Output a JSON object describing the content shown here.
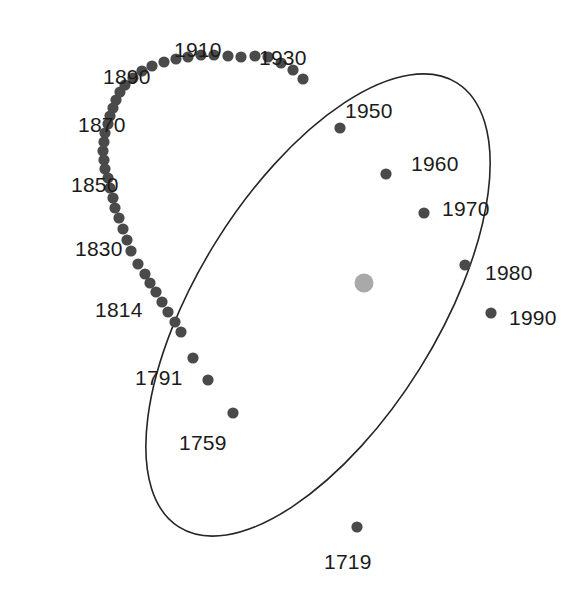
{
  "figure": {
    "kind": "orbital-ellipse-diagram",
    "background_color": "#ffffff",
    "width": 587,
    "height": 597
  },
  "chart_data": {
    "type": "scatter",
    "title": "",
    "subtitle": "",
    "xlabel": "",
    "ylabel": "",
    "grid": false,
    "legend": null,
    "axes_visible": false,
    "xlim": [
      0,
      587
    ],
    "ylim": [
      0,
      597
    ],
    "orbit_path": {
      "name": "orbit-ellipse",
      "stroke_color": "#262626",
      "stroke_width": 1.6,
      "fill": "none",
      "center_x": 318,
      "center_y": 305,
      "radius_x": 120,
      "radius_y": 262,
      "rotation_deg": 32
    },
    "central_body": {
      "name": "sun",
      "x": 364,
      "y": 283,
      "radius": 9.5,
      "color": "#a9a9a9"
    },
    "marker_style": {
      "color": "#4a4a4a",
      "radius": 5.6
    },
    "labels": [
      {
        "text": "1910",
        "x": 174,
        "y": 39
      },
      {
        "text": "1930",
        "x": 259,
        "y": 47
      },
      {
        "text": "1890",
        "x": 103,
        "y": 66
      },
      {
        "text": "1950",
        "x": 345,
        "y": 100
      },
      {
        "text": "1870",
        "x": 78,
        "y": 114
      },
      {
        "text": "1960",
        "x": 411,
        "y": 153
      },
      {
        "text": "1850",
        "x": 71,
        "y": 174
      },
      {
        "text": "1970",
        "x": 442,
        "y": 198
      },
      {
        "text": "1830",
        "x": 75,
        "y": 238
      },
      {
        "text": "1980",
        "x": 485,
        "y": 262
      },
      {
        "text": "1814",
        "x": 95,
        "y": 299
      },
      {
        "text": "1990",
        "x": 509,
        "y": 307
      },
      {
        "text": "1791",
        "x": 135,
        "y": 367
      },
      {
        "text": "1759",
        "x": 179,
        "y": 432
      },
      {
        "text": "1719",
        "x": 324,
        "y": 551
      }
    ],
    "points": [
      {
        "x": 268,
        "y": 57,
        "year": "1930"
      },
      {
        "x": 255,
        "y": 56,
        "year": ""
      },
      {
        "x": 241,
        "y": 57,
        "year": ""
      },
      {
        "x": 228,
        "y": 56,
        "year": ""
      },
      {
        "x": 214,
        "y": 55,
        "year": ""
      },
      {
        "x": 201,
        "y": 55,
        "year": "1910"
      },
      {
        "x": 188,
        "y": 57,
        "year": ""
      },
      {
        "x": 176,
        "y": 59,
        "year": ""
      },
      {
        "x": 164,
        "y": 62,
        "year": ""
      },
      {
        "x": 152,
        "y": 66,
        "year": ""
      },
      {
        "x": 142,
        "y": 71,
        "year": "1890"
      },
      {
        "x": 133,
        "y": 78,
        "year": ""
      },
      {
        "x": 125,
        "y": 85,
        "year": ""
      },
      {
        "x": 120,
        "y": 92,
        "year": ""
      },
      {
        "x": 116,
        "y": 100,
        "year": ""
      },
      {
        "x": 113,
        "y": 108,
        "year": ""
      },
      {
        "x": 110,
        "y": 116,
        "year": "1870"
      },
      {
        "x": 108,
        "y": 124,
        "year": ""
      },
      {
        "x": 105,
        "y": 133,
        "year": ""
      },
      {
        "x": 104,
        "y": 142,
        "year": ""
      },
      {
        "x": 103,
        "y": 151,
        "year": ""
      },
      {
        "x": 104,
        "y": 160,
        "year": ""
      },
      {
        "x": 105,
        "y": 169,
        "year": ""
      },
      {
        "x": 108,
        "y": 178,
        "year": "1850"
      },
      {
        "x": 110,
        "y": 188,
        "year": ""
      },
      {
        "x": 113,
        "y": 198,
        "year": ""
      },
      {
        "x": 115,
        "y": 208,
        "year": ""
      },
      {
        "x": 119,
        "y": 218,
        "year": ""
      },
      {
        "x": 123,
        "y": 229,
        "year": ""
      },
      {
        "x": 127,
        "y": 240,
        "year": "1830"
      },
      {
        "x": 131,
        "y": 251,
        "year": ""
      },
      {
        "x": 138,
        "y": 264,
        "year": ""
      },
      {
        "x": 145,
        "y": 274,
        "year": ""
      },
      {
        "x": 150,
        "y": 283,
        "year": ""
      },
      {
        "x": 156,
        "y": 292,
        "year": ""
      },
      {
        "x": 162,
        "y": 302,
        "year": "1814"
      },
      {
        "x": 168,
        "y": 312,
        "year": ""
      },
      {
        "x": 175,
        "y": 322,
        "year": ""
      },
      {
        "x": 181,
        "y": 332,
        "year": ""
      },
      {
        "x": 193,
        "y": 358,
        "year": "1791"
      },
      {
        "x": 208,
        "y": 380,
        "year": ""
      },
      {
        "x": 233,
        "y": 413,
        "year": "1759"
      },
      {
        "x": 357,
        "y": 527,
        "year": "1719"
      },
      {
        "x": 281,
        "y": 63,
        "year": ""
      },
      {
        "x": 293,
        "y": 70,
        "year": ""
      },
      {
        "x": 303,
        "y": 79,
        "year": ""
      },
      {
        "x": 340,
        "y": 128,
        "year": "1950"
      },
      {
        "x": 386,
        "y": 174,
        "year": "1960"
      },
      {
        "x": 424,
        "y": 213,
        "year": "1970"
      },
      {
        "x": 465,
        "y": 265,
        "year": "1980"
      },
      {
        "x": 491,
        "y": 313,
        "year": "1990"
      }
    ]
  }
}
